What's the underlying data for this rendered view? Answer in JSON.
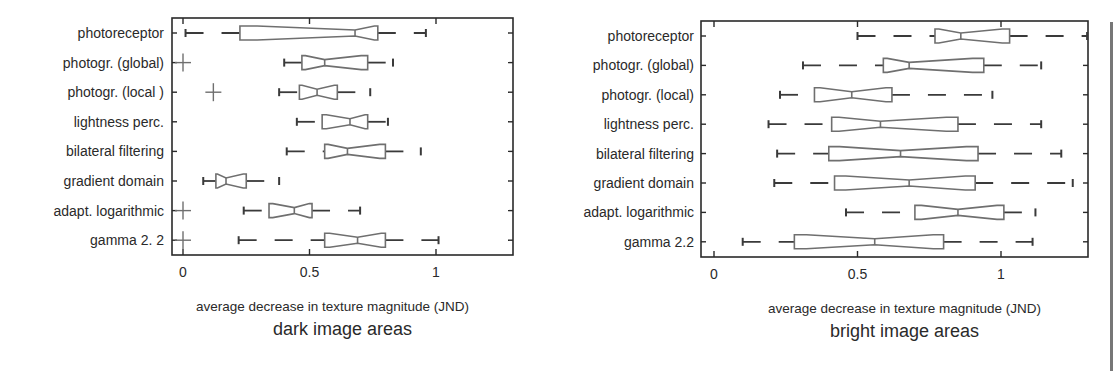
{
  "chart_data": [
    {
      "type": "boxplot",
      "orientation": "horizontal",
      "notched": true,
      "title": "dark image areas",
      "xlabel": "average decrease in texture magnitude (JND)",
      "ylabel": "",
      "xlim": [
        -0.04,
        1.3
      ],
      "xticks": [
        0,
        0.5,
        1
      ],
      "xtick_labels": [
        "0",
        "0.5",
        "1"
      ],
      "grid": false,
      "categories": [
        "photoreceptor",
        "photogr. (global)",
        "photogr. (local )",
        "lightness perc.",
        "bilateral filtering",
        "gradient domain",
        "adapt. logarithmic",
        "gamma 2. 2"
      ],
      "series": [
        {
          "name": "photoreceptor",
          "whisker_low": 0.01,
          "q1": 0.225,
          "median": 0.68,
          "q3": 0.77,
          "whisker_high": 0.96,
          "outliers": []
        },
        {
          "name": "photogr. (global)",
          "whisker_low": 0.4,
          "q1": 0.47,
          "median": 0.56,
          "q3": 0.73,
          "whisker_high": 0.83,
          "outliers": [
            0.0
          ]
        },
        {
          "name": "photogr. (local )",
          "whisker_low": 0.38,
          "q1": 0.46,
          "median": 0.53,
          "q3": 0.61,
          "whisker_high": 0.74,
          "outliers": [
            0.12
          ]
        },
        {
          "name": "lightness perc.",
          "whisker_low": 0.45,
          "q1": 0.55,
          "median": 0.66,
          "q3": 0.73,
          "whisker_high": 0.81,
          "outliers": []
        },
        {
          "name": "bilateral filtering",
          "whisker_low": 0.41,
          "q1": 0.56,
          "median": 0.65,
          "q3": 0.8,
          "whisker_high": 0.94,
          "outliers": []
        },
        {
          "name": "gradient domain",
          "whisker_low": 0.08,
          "q1": 0.13,
          "median": 0.17,
          "q3": 0.25,
          "whisker_high": 0.38,
          "outliers": []
        },
        {
          "name": "adapt. logarithmic",
          "whisker_low": 0.24,
          "q1": 0.34,
          "median": 0.44,
          "q3": 0.51,
          "whisker_high": 0.7,
          "outliers": [
            0.0
          ]
        },
        {
          "name": "gamma 2. 2",
          "whisker_low": 0.22,
          "q1": 0.56,
          "median": 0.69,
          "q3": 0.8,
          "whisker_high": 1.01,
          "outliers": [
            0.0
          ]
        }
      ],
      "layout": {
        "box_left": 172,
        "box_top": 18,
        "box_right": 513,
        "box_bottom": 255,
        "x0_px": 183,
        "px_per_unit": 253,
        "row_top": 33,
        "row_step": 29.6,
        "label_right": 164
      }
    },
    {
      "type": "boxplot",
      "orientation": "horizontal",
      "notched": true,
      "title": "bright image areas",
      "xlabel": "average decrease in texture magnitude (JND)",
      "ylabel": "",
      "xlim": [
        -0.045,
        1.3
      ],
      "xticks": [
        0,
        0.5,
        1
      ],
      "xtick_labels": [
        "0",
        "0.5",
        "1"
      ],
      "grid": false,
      "categories": [
        "photoreceptor",
        "photogr. (global)",
        "photogr. (local)",
        "lightness perc.",
        "bilateral filtering",
        "gradient domain",
        "adapt. logarithmic",
        "gamma 2.2"
      ],
      "series": [
        {
          "name": "photoreceptor",
          "whisker_low": 0.5,
          "q1": 0.77,
          "median": 0.86,
          "q3": 1.03,
          "whisker_high": 1.3,
          "outliers": []
        },
        {
          "name": "photogr. (global)",
          "whisker_low": 0.31,
          "q1": 0.59,
          "median": 0.68,
          "q3": 0.94,
          "whisker_high": 1.14,
          "outliers": []
        },
        {
          "name": "photogr. (local)",
          "whisker_low": 0.23,
          "q1": 0.35,
          "median": 0.48,
          "q3": 0.62,
          "whisker_high": 0.97,
          "outliers": []
        },
        {
          "name": "lightness perc.",
          "whisker_low": 0.19,
          "q1": 0.41,
          "median": 0.58,
          "q3": 0.85,
          "whisker_high": 1.14,
          "outliers": []
        },
        {
          "name": "bilateral filtering",
          "whisker_low": 0.22,
          "q1": 0.4,
          "median": 0.65,
          "q3": 0.92,
          "whisker_high": 1.21,
          "outliers": []
        },
        {
          "name": "gradient domain",
          "whisker_low": 0.21,
          "q1": 0.42,
          "median": 0.68,
          "q3": 0.91,
          "whisker_high": 1.25,
          "outliers": []
        },
        {
          "name": "adapt. logarithmic",
          "whisker_low": 0.46,
          "q1": 0.7,
          "median": 0.85,
          "q3": 1.01,
          "whisker_high": 1.12,
          "outliers": []
        },
        {
          "name": "gamma 2.2",
          "whisker_low": 0.1,
          "q1": 0.28,
          "median": 0.56,
          "q3": 0.8,
          "whisker_high": 1.11,
          "outliers": []
        }
      ],
      "layout": {
        "box_left": 701,
        "box_top": 21,
        "box_right": 1088,
        "box_bottom": 257,
        "x0_px": 714,
        "px_per_unit": 287,
        "row_top": 36,
        "row_step": 29.4,
        "label_right": 694
      }
    }
  ],
  "style": {
    "stroke": "#6f6f6f",
    "axis": "#2a2a2a",
    "whisker": "#3a3a3a",
    "background": "#ffffff"
  }
}
